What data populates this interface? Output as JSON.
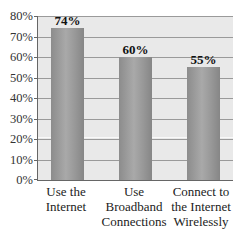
{
  "chart_data": {
    "type": "bar",
    "title": "",
    "xlabel": "",
    "ylabel": "",
    "categories": [
      "Use the Internet",
      "Use Broadband Connections at Home",
      "Connect to the Internet Wirelessly"
    ],
    "category_lines": [
      [
        "Use the",
        "Internet"
      ],
      [
        "Use Broadband",
        "Connections",
        "at Home"
      ],
      [
        "Connect to",
        "the Internet",
        "Wirelessly"
      ]
    ],
    "values": [
      74,
      60,
      55
    ],
    "value_labels": [
      "74%",
      "60%",
      "55%"
    ],
    "ylim": [
      0,
      80
    ],
    "yticks": [
      "0%",
      "10%",
      "20%",
      "30%",
      "40%",
      "50%",
      "60%",
      "70%",
      "80%"
    ],
    "grid": true,
    "legend": null
  },
  "colors": {
    "plot_background": "#e9e9e9",
    "bar": "#9a9a9a",
    "grid": "#9a9a9a",
    "axis": "#666666"
  }
}
